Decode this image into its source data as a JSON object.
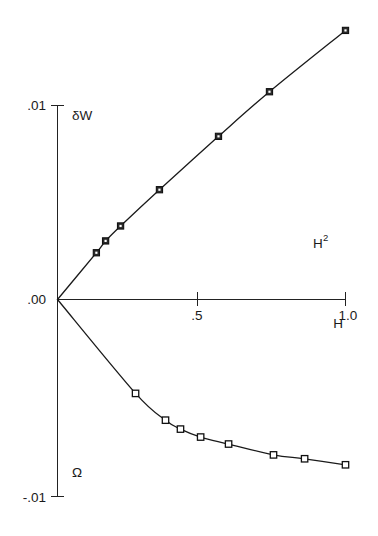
{
  "figure": {
    "background_color": "#ffffff",
    "ink_color": "#1a1a1a"
  },
  "axes": {
    "y_axis": {
      "name": "y-axis",
      "ticks": [
        {
          "label": ".01",
          "value": 0.01
        },
        {
          "label": ".00",
          "value": 0.0
        },
        {
          "label": "-.01",
          "value": -0.01
        }
      ]
    },
    "x_axis": {
      "name": "x-axis",
      "label_main": "H",
      "label_sup": "2",
      "label_secondary": "H",
      "ticks": [
        {
          "label": ".5",
          "value": 0.5
        },
        {
          "label": "1.0",
          "value": 1.0
        }
      ]
    }
  },
  "series_labels": {
    "upper": "δW",
    "lower": "Ω"
  },
  "chart_data": {
    "type": "line",
    "title": "",
    "xlabel": "H^2",
    "ylabel": "",
    "xlim": [
      0.0,
      1.0
    ],
    "ylim": [
      -0.01,
      0.014
    ],
    "grid": false,
    "legend_position": "inline-annotations",
    "x_ticks": [
      0.0,
      0.5,
      1.0
    ],
    "x_tick_labels": [
      ".00",
      ".5",
      "1.0"
    ],
    "y_ticks": [
      -0.01,
      0.0,
      0.01
    ],
    "y_tick_labels": [
      "-.01",
      ".00",
      ".01"
    ],
    "series": [
      {
        "name": "δW",
        "marker": "filled-square",
        "x": [
          0.0,
          0.135,
          0.167,
          0.219,
          0.354,
          0.559,
          0.736,
          1.0
        ],
        "y": [
          0.0,
          0.00241,
          0.00302,
          0.00379,
          0.00566,
          0.00841,
          0.01071,
          0.01387
        ]
      },
      {
        "name": "Ω",
        "marker": "open-square",
        "x": [
          0.0,
          0.271,
          0.375,
          0.427,
          0.497,
          0.594,
          0.75,
          0.858,
          1.0
        ],
        "y": [
          0.0,
          -0.00484,
          -0.00622,
          -0.00668,
          -0.00709,
          -0.00745,
          -0.00801,
          -0.00821,
          -0.00852
        ]
      }
    ],
    "annotations": [
      {
        "text": "δW",
        "x": 0.1,
        "y": 0.0087
      },
      {
        "text": "Ω",
        "x": 0.1,
        "y": -0.0082
      },
      {
        "text": "H",
        "x": 0.99,
        "y": 0.0026,
        "superscript": "2"
      },
      {
        "text": "H",
        "x": 0.99,
        "y": -0.0012
      }
    ]
  }
}
